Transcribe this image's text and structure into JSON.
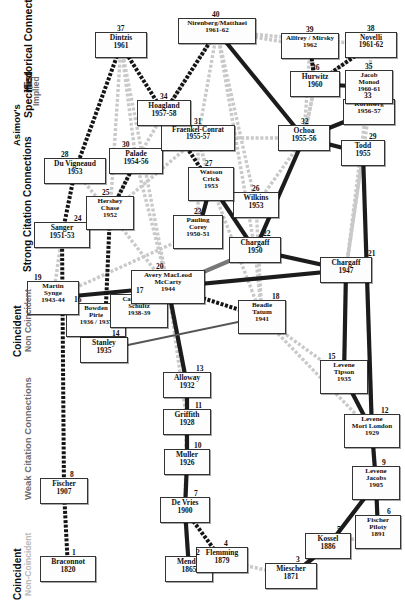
{
  "figure": {
    "background": "#ffffff"
  },
  "legend": {
    "groups": [
      {
        "name": "asimov",
        "lines": [
          {
            "text": "Asimov's",
            "tone": "dark",
            "size": 9.5
          },
          {
            "text": "Specified",
            "tone": "dark",
            "size": 10.5
          },
          {
            "text": "Implied",
            "tone": "mid",
            "size": 8.5
          },
          {
            "text": "Historical Connections",
            "tone": "dark",
            "size": 10.5
          }
        ]
      },
      {
        "name": "strong-citation",
        "lines": [
          {
            "text": "Coincident",
            "tone": "dark",
            "size": 10
          },
          {
            "text": "Non Coincident",
            "tone": "mid",
            "size": 8.5
          },
          {
            "text": "Strong Citation Connections",
            "tone": "dark",
            "size": 10
          }
        ]
      },
      {
        "name": "weak-citation",
        "lines": [
          {
            "text": "Coincident",
            "tone": "dark",
            "size": 10
          },
          {
            "text": "Non-Coincident",
            "tone": "light",
            "size": 8.5
          },
          {
            "text": "Weak Citation Connections",
            "tone": "mid",
            "size": 9.5
          }
        ]
      }
    ]
  },
  "colors": {
    "specified_historical": "#141414",
    "implied_historical": "#9a9a9a",
    "strong_coincident": "#1c1c1c",
    "strong_noncoincident": "#777777",
    "weak_coincident": "#555555",
    "weak_noncoincident": "#c9c9c9",
    "node_border": "#333333",
    "node_fill": "#fdfdfd",
    "text": "#111111"
  },
  "chart_data": {
    "type": "diagram",
    "nodes": [
      {
        "id": 1,
        "label": "Braconnot",
        "year": "1820",
        "x": 40,
        "y": 556,
        "w": 56,
        "h": 26,
        "lines": [
          "Braconnot",
          "1820"
        ],
        "fs": 7.5
      },
      {
        "id": 2,
        "label": "Mendel",
        "year": "1865",
        "x": 165,
        "y": 556,
        "w": 48,
        "h": 26,
        "lines": [
          "Mendel",
          "1865"
        ],
        "fs": 7.5
      },
      {
        "id": 3,
        "label": "Miescher",
        "year": "1871",
        "x": 265,
        "y": 563,
        "w": 52,
        "h": 26,
        "lines": [
          "Miescher",
          "1871"
        ],
        "fs": 7.5
      },
      {
        "id": 4,
        "label": "Flemming",
        "year": "1879",
        "x": 196,
        "y": 547,
        "w": 52,
        "h": 26,
        "lines": [
          "Flemming",
          "1879"
        ],
        "fs": 7.5
      },
      {
        "id": 5,
        "label": "Kossel",
        "year": "1886",
        "x": 305,
        "y": 533,
        "w": 46,
        "h": 26,
        "lines": [
          "Kossel",
          "1886"
        ],
        "fs": 7.5
      },
      {
        "id": 6,
        "label": "Fischer Piloty",
        "year": "1891",
        "x": 355,
        "y": 515,
        "w": 46,
        "h": 34,
        "lines": [
          "Fischer",
          "Piloty",
          "1891"
        ],
        "fs": 7
      },
      {
        "id": 7,
        "label": "De Vries",
        "year": "1900",
        "x": 160,
        "y": 497,
        "w": 50,
        "h": 26,
        "lines": [
          "De Vries",
          "1900"
        ],
        "fs": 7.5
      },
      {
        "id": 8,
        "label": "Fischer",
        "year": "1907",
        "x": 40,
        "y": 478,
        "w": 48,
        "h": 26,
        "lines": [
          "Fischer",
          "1907"
        ],
        "fs": 7.5
      },
      {
        "id": 9,
        "label": "Levene Jacobs",
        "year": "1905",
        "x": 352,
        "y": 466,
        "w": 48,
        "h": 34,
        "lines": [
          "Levene",
          "Jacobs",
          "1905"
        ],
        "fs": 7
      },
      {
        "id": 10,
        "label": "Muller",
        "year": "1926",
        "x": 164,
        "y": 449,
        "w": 46,
        "h": 26,
        "lines": [
          "Muller",
          "1926"
        ],
        "fs": 7.5
      },
      {
        "id": 11,
        "label": "Griffith",
        "year": "1928",
        "x": 163,
        "y": 409,
        "w": 48,
        "h": 26,
        "lines": [
          "Griffith",
          "1928"
        ],
        "fs": 7.5
      },
      {
        "id": 12,
        "label": "Levene Mori London",
        "year": "1929",
        "x": 344,
        "y": 414,
        "w": 56,
        "h": 34,
        "lines": [
          "Levene",
          "Mori  London",
          "1929"
        ],
        "fs": 7
      },
      {
        "id": 13,
        "label": "Alloway",
        "year": "1932",
        "x": 163,
        "y": 372,
        "w": 48,
        "h": 26,
        "lines": [
          "Alloway",
          "1932"
        ],
        "fs": 7.5
      },
      {
        "id": 14,
        "label": "Stanley",
        "year": "1935",
        "x": 80,
        "y": 337,
        "w": 48,
        "h": 26,
        "lines": [
          "Stanley",
          "1935"
        ],
        "fs": 7.5
      },
      {
        "id": 15,
        "label": "Levene Tipson",
        "year": "1935",
        "x": 320,
        "y": 360,
        "w": 48,
        "h": 34,
        "lines": [
          "Levene",
          "Tipson",
          "1935"
        ],
        "fs": 7
      },
      {
        "id": 16,
        "label": "Bowden Pirie",
        "year": "1936/1937",
        "x": 66,
        "y": 303,
        "w": 60,
        "h": 34,
        "lines": [
          "Bowden",
          "Pirie",
          "1936 / 1937"
        ],
        "fs": 6.8
      },
      {
        "id": 17,
        "label": "Caspersson Schultz",
        "year": "1938-39",
        "x": 110,
        "y": 294,
        "w": 58,
        "h": 34,
        "lines": [
          "Caspersson",
          "Schultz",
          "1938-39"
        ],
        "fs": 6.8
      },
      {
        "id": 18,
        "label": "Beadle Tatum",
        "year": "1941",
        "x": 238,
        "y": 300,
        "w": 48,
        "h": 34,
        "lines": [
          "Beadle",
          "Tatum",
          "1941"
        ],
        "fs": 7
      },
      {
        "id": 19,
        "label": "Martin Synge",
        "year": "1943-44",
        "x": 27,
        "y": 281,
        "w": 52,
        "h": 34,
        "lines": [
          "Martin",
          "Synge",
          "1943-44"
        ],
        "fs": 7
      },
      {
        "id": 20,
        "label": "Avery MacLeod McCarty",
        "year": "1944",
        "x": 131,
        "y": 270,
        "w": 74,
        "h": 34,
        "lines": [
          "Avery MacLeod",
          "McCarty",
          "1944"
        ],
        "fs": 7
      },
      {
        "id": 21,
        "label": "Chargaff",
        "year": "1947",
        "x": 320,
        "y": 257,
        "w": 52,
        "h": 26,
        "lines": [
          "Chargaff",
          "1947"
        ],
        "fs": 7.5
      },
      {
        "id": 22,
        "label": "Chargaff",
        "year": "1950",
        "x": 229,
        "y": 237,
        "w": 52,
        "h": 26,
        "lines": [
          "Chargaff",
          "1950"
        ],
        "fs": 7.5
      },
      {
        "id": 23,
        "label": "Pauling Corey",
        "year": "1950-51",
        "x": 173,
        "y": 215,
        "w": 50,
        "h": 34,
        "lines": [
          "Pauling",
          "Corey",
          "1950-51"
        ],
        "fs": 7
      },
      {
        "id": 24,
        "label": "Sanger",
        "year": "1951-53",
        "x": 34,
        "y": 222,
        "w": 56,
        "h": 26,
        "lines": [
          "Sanger",
          "1951-53"
        ],
        "fs": 7.5
      },
      {
        "id": 25,
        "label": "Hershey Chase",
        "year": "1952",
        "x": 86,
        "y": 196,
        "w": 48,
        "h": 34,
        "lines": [
          "Hershey",
          "Chase",
          "1952"
        ],
        "fs": 7
      },
      {
        "id": 26,
        "label": "Wilkins",
        "year": "1953",
        "x": 233,
        "y": 192,
        "w": 46,
        "h": 26,
        "lines": [
          "Wilkins",
          "1953"
        ],
        "fs": 7.5
      },
      {
        "id": 27,
        "label": "Watson Crick",
        "year": "1953",
        "x": 188,
        "y": 167,
        "w": 46,
        "h": 34,
        "lines": [
          "Watson",
          "Crick",
          "1953"
        ],
        "fs": 7
      },
      {
        "id": 28,
        "label": "Du Vigneaud",
        "year": "1953",
        "x": 44,
        "y": 158,
        "w": 62,
        "h": 26,
        "lines": [
          "Du Vigneaud",
          "1953"
        ],
        "fs": 7.5
      },
      {
        "id": 29,
        "label": "Todd",
        "year": "1955",
        "x": 341,
        "y": 140,
        "w": 44,
        "h": 26,
        "lines": [
          "Todd",
          "1955"
        ],
        "fs": 7.5
      },
      {
        "id": 30,
        "label": "Palade",
        "year": "1954-56",
        "x": 109,
        "y": 148,
        "w": 54,
        "h": 26,
        "lines": [
          "Palade",
          "1954-56"
        ],
        "fs": 7.5
      },
      {
        "id": 31,
        "label": "Fraenkel-Conrat",
        "year": "1955-57",
        "x": 161,
        "y": 125,
        "w": 74,
        "h": 26,
        "lines": [
          "Fraenkel-Conrat",
          "1955-57"
        ],
        "fs": 7.2
      },
      {
        "id": 32,
        "label": "Ochoa",
        "year": "1955-56",
        "x": 278,
        "y": 125,
        "w": 52,
        "h": 26,
        "lines": [
          "Ochoa",
          "1955-56"
        ],
        "fs": 7.5
      },
      {
        "id": 33,
        "label": "Kornberg",
        "year": "1956-57",
        "x": 343,
        "y": 99,
        "w": 52,
        "h": 26,
        "lines": [
          "Kornberg",
          "1956-57"
        ],
        "fs": 7
      },
      {
        "id": 34,
        "label": "Hoagland",
        "year": "1957-58",
        "x": 137,
        "y": 100,
        "w": 54,
        "h": 26,
        "lines": [
          "Hoagland",
          "1957-58"
        ],
        "fs": 7.5
      },
      {
        "id": 35,
        "label": "Jacob Monod",
        "year": "1960-61",
        "x": 345,
        "y": 70,
        "w": 48,
        "h": 34,
        "lines": [
          "Jacob",
          "Monod",
          "1960-61"
        ],
        "fs": 6.8
      },
      {
        "id": 36,
        "label": "Hurwitz",
        "year": "1960",
        "x": 290,
        "y": 71,
        "w": 50,
        "h": 26,
        "lines": [
          "Hurwitz",
          "1960"
        ],
        "fs": 7.5
      },
      {
        "id": 37,
        "label": "Dintzis",
        "year": "1961",
        "x": 95,
        "y": 32,
        "w": 52,
        "h": 26,
        "lines": [
          "Dintzis",
          "1961"
        ],
        "fs": 7.5
      },
      {
        "id": 38,
        "label": "Novelli",
        "year": "1961-62",
        "x": 345,
        "y": 32,
        "w": 52,
        "h": 26,
        "lines": [
          "Novelli",
          "1961-62"
        ],
        "fs": 7.3
      },
      {
        "id": 39,
        "label": "Allfrey / Mirsky",
        "year": "1962",
        "x": 281,
        "y": 33,
        "w": 58,
        "h": 26,
        "lines": [
          "Allfrey / Mirsky",
          "1962"
        ],
        "fs": 7
      },
      {
        "id": 40,
        "label": "Nirenberg/Matthaei",
        "year": "1961-62",
        "x": 178,
        "y": 18,
        "w": 78,
        "h": 26,
        "lines": [
          "Nirenberg/Matthaei",
          "1961-62"
        ],
        "fs": 7
      }
    ],
    "node_index_labels": [
      {
        "id": 1,
        "x": 72,
        "y": 548
      },
      {
        "id": 2,
        "x": 196,
        "y": 548
      },
      {
        "id": 3,
        "x": 296,
        "y": 555
      },
      {
        "id": 4,
        "x": 224,
        "y": 539
      },
      {
        "id": 5,
        "x": 337,
        "y": 525
      },
      {
        "id": 6,
        "x": 387,
        "y": 507
      },
      {
        "id": 7,
        "x": 194,
        "y": 489
      },
      {
        "id": 8,
        "x": 70,
        "y": 470
      },
      {
        "id": 9,
        "x": 382,
        "y": 458
      },
      {
        "id": 10,
        "x": 194,
        "y": 441
      },
      {
        "id": 11,
        "x": 195,
        "y": 401
      },
      {
        "id": 12,
        "x": 381,
        "y": 406
      },
      {
        "id": 13,
        "x": 196,
        "y": 364
      },
      {
        "id": 14,
        "x": 112,
        "y": 329
      },
      {
        "id": 15,
        "x": 328,
        "y": 352
      },
      {
        "id": 16,
        "x": 74,
        "y": 295
      },
      {
        "id": 17,
        "x": 136,
        "y": 286
      },
      {
        "id": 18,
        "x": 272,
        "y": 292
      },
      {
        "id": 19,
        "x": 34,
        "y": 273
      },
      {
        "id": 20,
        "x": 156,
        "y": 262
      },
      {
        "id": 21,
        "x": 368,
        "y": 249
      },
      {
        "id": 22,
        "x": 263,
        "y": 229
      },
      {
        "id": 23,
        "x": 194,
        "y": 207
      },
      {
        "id": 24,
        "x": 74,
        "y": 214
      },
      {
        "id": 25,
        "x": 102,
        "y": 188
      },
      {
        "id": 26,
        "x": 252,
        "y": 184
      },
      {
        "id": 27,
        "x": 205,
        "y": 159
      },
      {
        "id": 28,
        "x": 61,
        "y": 150
      },
      {
        "id": 29,
        "x": 369,
        "y": 132
      },
      {
        "id": 30,
        "x": 122,
        "y": 140
      },
      {
        "id": 31,
        "x": 194,
        "y": 117
      },
      {
        "id": 32,
        "x": 301,
        "y": 117
      },
      {
        "id": 33,
        "x": 364,
        "y": 91
      },
      {
        "id": 34,
        "x": 160,
        "y": 92
      },
      {
        "id": 35,
        "x": 365,
        "y": 62
      },
      {
        "id": 36,
        "x": 312,
        "y": 63
      },
      {
        "id": 37,
        "x": 117,
        "y": 24
      },
      {
        "id": 38,
        "x": 367,
        "y": 24
      },
      {
        "id": 39,
        "x": 306,
        "y": 25
      },
      {
        "id": 40,
        "x": 212,
        "y": 10
      }
    ],
    "edges": [
      {
        "from": 1,
        "to": 8,
        "style": "specified_historical"
      },
      {
        "from": 8,
        "to": 24,
        "style": "specified_historical"
      },
      {
        "from": 24,
        "to": 28,
        "style": "specified_historical"
      },
      {
        "from": 28,
        "to": 37,
        "style": "specified_historical"
      },
      {
        "from": 2,
        "to": 7,
        "style": "strong_coincident"
      },
      {
        "from": 7,
        "to": 10,
        "style": "strong_coincident"
      },
      {
        "from": 10,
        "to": 11,
        "style": "strong_coincident"
      },
      {
        "from": 11,
        "to": 13,
        "style": "strong_coincident"
      },
      {
        "from": 13,
        "to": 20,
        "style": "strong_coincident"
      },
      {
        "from": 7,
        "to": 4,
        "style": "specified_historical"
      },
      {
        "from": 4,
        "to": 3,
        "style": "weak_noncoincident"
      },
      {
        "from": 3,
        "to": 5,
        "style": "strong_coincident"
      },
      {
        "from": 5,
        "to": 9,
        "style": "strong_coincident"
      },
      {
        "from": 5,
        "to": 6,
        "style": "weak_noncoincident"
      },
      {
        "from": 6,
        "to": 9,
        "style": "strong_coincident"
      },
      {
        "from": 9,
        "to": 12,
        "style": "strong_coincident"
      },
      {
        "from": 12,
        "to": 15,
        "style": "strong_coincident"
      },
      {
        "from": 15,
        "to": 21,
        "style": "strong_coincident"
      },
      {
        "from": 21,
        "to": 22,
        "style": "strong_coincident"
      },
      {
        "from": 21,
        "to": 20,
        "style": "strong_coincident"
      },
      {
        "from": 22,
        "to": 20,
        "style": "strong_noncoincident"
      },
      {
        "from": 22,
        "to": 27,
        "style": "strong_coincident"
      },
      {
        "from": 22,
        "to": 32,
        "style": "strong_coincident"
      },
      {
        "from": 20,
        "to": 18,
        "style": "specified_historical"
      },
      {
        "from": 18,
        "to": 14,
        "style": "weak_coincident"
      },
      {
        "from": 20,
        "to": 19,
        "style": "strong_coincident"
      },
      {
        "from": 20,
        "to": 17,
        "style": "weak_noncoincident"
      },
      {
        "from": 17,
        "to": 16,
        "style": "weak_noncoincident"
      },
      {
        "from": 16,
        "to": 14,
        "style": "strong_coincident"
      },
      {
        "from": 14,
        "to": 25,
        "style": "specified_historical"
      },
      {
        "from": 25,
        "to": 30,
        "style": "specified_historical"
      },
      {
        "from": 23,
        "to": 27,
        "style": "strong_coincident"
      },
      {
        "from": 26,
        "to": 27,
        "style": "strong_coincident"
      },
      {
        "from": 27,
        "to": 31,
        "style": "weak_noncoincident"
      },
      {
        "from": 27,
        "to": 34,
        "style": "specified_historical"
      },
      {
        "from": 31,
        "to": 32,
        "style": "weak_noncoincident"
      },
      {
        "from": 32,
        "to": 29,
        "style": "strong_coincident"
      },
      {
        "from": 32,
        "to": 33,
        "style": "strong_coincident"
      },
      {
        "from": 32,
        "to": 36,
        "style": "weak_noncoincident"
      },
      {
        "from": 32,
        "to": 40,
        "style": "strong_coincident"
      },
      {
        "from": 33,
        "to": 35,
        "style": "weak_noncoincident"
      },
      {
        "from": 35,
        "to": 36,
        "style": "strong_coincident"
      },
      {
        "from": 36,
        "to": 38,
        "style": "specified_historical"
      },
      {
        "from": 36,
        "to": 39,
        "style": "specified_historical"
      },
      {
        "from": 34,
        "to": 40,
        "style": "specified_historical"
      },
      {
        "from": 37,
        "to": 34,
        "style": "specified_historical"
      },
      {
        "from": 29,
        "to": 12,
        "style": "strong_coincident"
      },
      {
        "from": 40,
        "to": 38,
        "style": "weak_noncoincident"
      },
      {
        "from": 40,
        "to": 39,
        "style": "weak_noncoincident"
      }
    ]
  }
}
